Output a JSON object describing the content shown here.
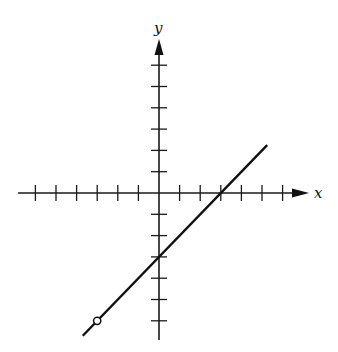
{
  "chart_data": {
    "type": "line",
    "title": "",
    "xlabel": "x",
    "ylabel": "y",
    "xlim": [
      -6,
      6
    ],
    "ylim": [
      -6,
      6
    ],
    "x_ticks": [
      -6,
      -5,
      -4,
      -3,
      -2,
      -1,
      1,
      2,
      3,
      4,
      5,
      6
    ],
    "y_ticks": [
      -6,
      -5,
      -4,
      -3,
      -2,
      -1,
      1,
      2,
      3,
      4,
      5,
      6
    ],
    "tick_labels_shown": false,
    "grid": false,
    "legend": null,
    "series": [
      {
        "name": "line",
        "equation": "y = x - 3",
        "x": [
          -3.7,
          5.25
        ],
        "y": [
          -6.7,
          2.25
        ],
        "x_intercept": 3,
        "y_intercept": -3
      }
    ],
    "annotations": [
      {
        "type": "open-circle",
        "x": -3,
        "y": -6
      }
    ]
  },
  "labels": {
    "x_axis": "x",
    "y_axis": "y"
  },
  "colors": {
    "ink": "#111111",
    "background": "#ffffff"
  }
}
